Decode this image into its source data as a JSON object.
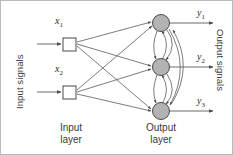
{
  "figure": {
    "type": "neural-network-diagram",
    "width": 233,
    "height": 155
  },
  "labels": {
    "input_signals": "Input signals",
    "output_signals": "Output signals",
    "input_layer_line1": "Input",
    "input_layer_line2": "layer",
    "output_layer_line1": "Output",
    "output_layer_line2": "layer"
  },
  "inputs": [
    {
      "id": "x1",
      "symbol": "x",
      "subscript": "1",
      "cx": 68,
      "cy": 43
    },
    {
      "id": "x2",
      "symbol": "x",
      "subscript": "2",
      "cx": 68,
      "cy": 91
    }
  ],
  "outputs": [
    {
      "id": "y1",
      "symbol": "y",
      "subscript": "1",
      "cx": 160,
      "cy": 22
    },
    {
      "id": "y2",
      "symbol": "y",
      "subscript": "2",
      "cx": 160,
      "cy": 66
    },
    {
      "id": "y3",
      "symbol": "y",
      "subscript": "3",
      "cx": 160,
      "cy": 110
    }
  ],
  "connections": {
    "feedforward_count": 6,
    "recurrent_arc_count": 8,
    "description": "Every input square connects to every output neuron; output neurons are mutually connected by curved feedback arcs"
  },
  "colors": {
    "background": "#ffffff",
    "frame": "#b9b9b9",
    "neuron_fill": "#b3b3b3",
    "neuron_stroke": "#4a4a4a",
    "input_fill": "#ffffff",
    "input_stroke": "#4a4a4a",
    "line": "#5a5a5a",
    "text": "#3a3a3a"
  }
}
